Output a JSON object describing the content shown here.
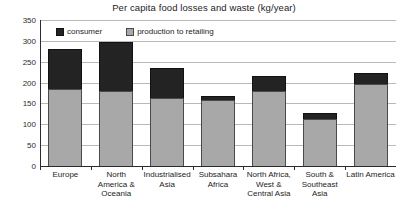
{
  "chart_data": {
    "type": "bar",
    "subtype": "stacked-bar",
    "title": "Per capita food losses and waste (kg/year)",
    "xlabel": "",
    "ylabel": "",
    "ylim": [
      0,
      350
    ],
    "ytick_step": 50,
    "yticks": [
      350,
      300,
      250,
      200,
      150,
      100,
      50,
      0
    ],
    "grid": true,
    "legend_position": "top-left-inside",
    "categories": [
      "Europe",
      "North America & Oceania",
      "Industrialised Asia",
      "Subsahara Africa",
      "North Africa, West & Central Asia",
      "South & Southeast Asia",
      "Latin America"
    ],
    "category_label_lines": [
      [
        "Europe"
      ],
      [
        "North",
        "America &",
        "Oceania"
      ],
      [
        "Industrialised",
        "Asia"
      ],
      [
        "Subsahara",
        "Africa"
      ],
      [
        "North Africa,",
        "West &",
        "Central Asia"
      ],
      [
        "South &",
        "Southeast",
        "Asia"
      ],
      [
        "Latin America"
      ]
    ],
    "series": [
      {
        "name": "production to retailing",
        "color": "#a8a8a8",
        "values": [
          185,
          180,
          163,
          158,
          179,
          113,
          197
        ]
      },
      {
        "name": "consumer",
        "color": "#232323",
        "values": [
          96,
          117,
          73,
          9,
          38,
          13,
          25
        ]
      }
    ],
    "totals": [
      281,
      297,
      236,
      167,
      217,
      126,
      222
    ]
  },
  "legend": {
    "entries": [
      {
        "label": "consumer",
        "swatch": "black-square-icon"
      },
      {
        "label": "production to retailing",
        "swatch": "gray-square-icon"
      }
    ]
  }
}
